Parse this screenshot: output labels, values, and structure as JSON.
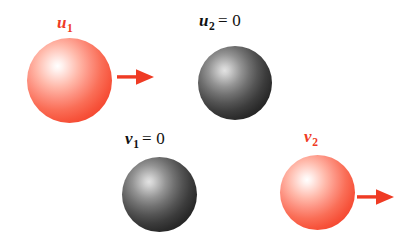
{
  "figure": {
    "background_color": "#ffffff",
    "width": 416,
    "height": 240
  },
  "colors": {
    "red_accent": "#ef3b24",
    "red_ball_edge": "#e82f1b",
    "red_ball_highlight": "#ffffff",
    "dark_ball_edge": "#0d0d0d",
    "dark_ball_highlight": "#e2e2e2",
    "label_dark": "#111111"
  },
  "rows": [
    {
      "name": "before-collision",
      "labels": {
        "left": {
          "variable": "u",
          "subscript": "1",
          "equals": "",
          "color": "#ef3b24"
        },
        "right": {
          "variable": "u",
          "subscript": "2",
          "equals": "= 0",
          "color": "#111111"
        }
      },
      "balls": [
        {
          "id": "u1",
          "style": "red",
          "moving": true
        },
        {
          "id": "u2",
          "style": "dark",
          "moving": false
        }
      ],
      "arrow": {
        "direction": "right",
        "color": "#ef3b24"
      }
    },
    {
      "name": "after-collision",
      "labels": {
        "left": {
          "variable": "v",
          "subscript": "1",
          "equals": "= 0",
          "color": "#111111"
        },
        "right": {
          "variable": "v",
          "subscript": "2",
          "equals": "",
          "color": "#ef3b24"
        }
      },
      "balls": [
        {
          "id": "v1",
          "style": "dark",
          "moving": false
        },
        {
          "id": "v2",
          "style": "red",
          "moving": true
        }
      ],
      "arrow": {
        "direction": "right",
        "color": "#ef3b24"
      }
    }
  ],
  "icons": {
    "arrow_right": "arrow-right-icon"
  }
}
